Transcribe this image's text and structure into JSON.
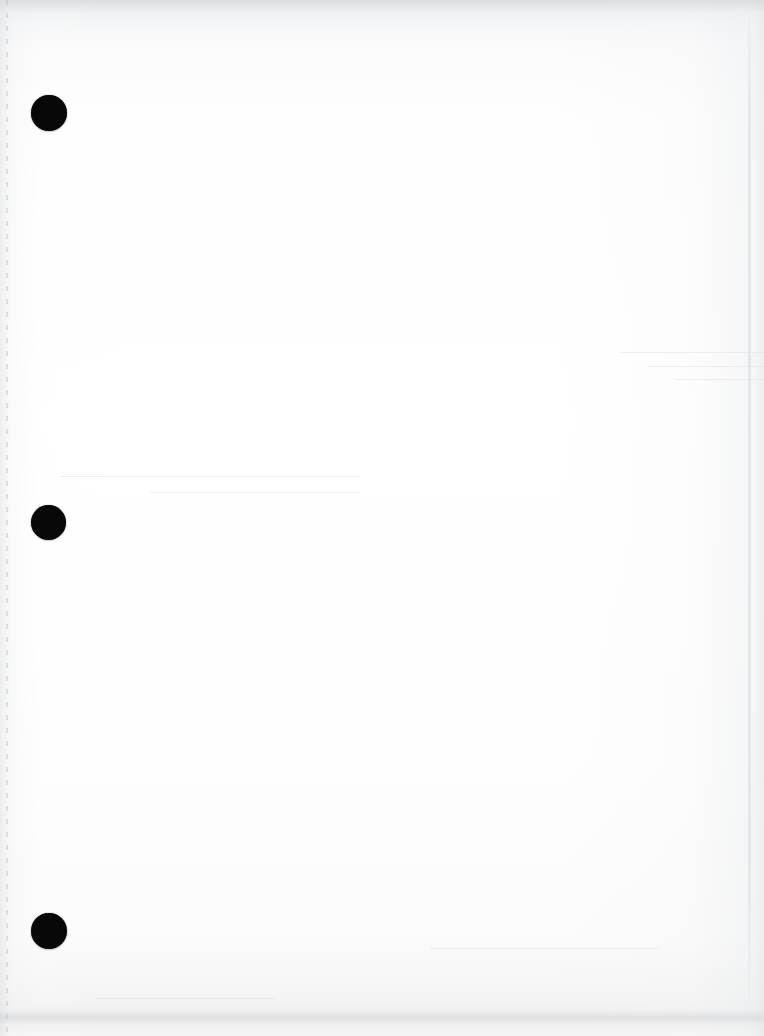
{
  "document": {
    "kind": "scanned-page",
    "page_state": "blank",
    "width": 764,
    "height": 1036,
    "paper_color": "#fefefe",
    "ink_color": "#080808",
    "visible_text": ""
  },
  "punch_holes": {
    "count": 3,
    "shape": "circle",
    "color": "#080808",
    "items": [
      {
        "name": "punch-hole-top",
        "cx": 49,
        "cy": 113,
        "d": 36
      },
      {
        "name": "punch-hole-middle",
        "cx": 48,
        "cy": 522,
        "d": 35
      },
      {
        "name": "punch-hole-bottom",
        "cx": 49,
        "cy": 931,
        "d": 36
      }
    ]
  },
  "scan_artifacts": {
    "top_band_color": "#eef0f1",
    "bottom_band_color": "#f2f2f2",
    "left_edge_line_x": 7,
    "right_edge_line_x": 749,
    "streaks": [
      {
        "x": 620,
        "y": 352,
        "w": 144
      },
      {
        "x": 648,
        "y": 366,
        "w": 116
      },
      {
        "x": 676,
        "y": 379,
        "w": 88
      },
      {
        "x": 60,
        "y": 476,
        "w": 300
      },
      {
        "x": 150,
        "y": 492,
        "w": 210
      },
      {
        "x": 430,
        "y": 948,
        "w": 230
      },
      {
        "x": 96,
        "y": 998,
        "w": 180
      }
    ]
  }
}
